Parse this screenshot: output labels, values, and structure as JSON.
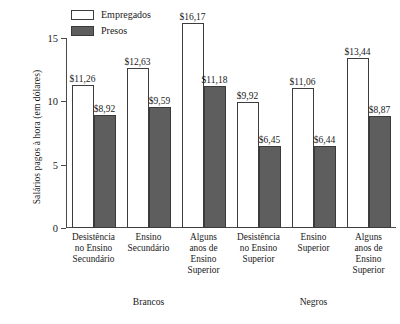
{
  "chart_data": {
    "type": "bar",
    "title": "",
    "xlabel": "",
    "ylabel": "Salários pagos à hora (em dólares)",
    "ylim": [
      0,
      15
    ],
    "yticks": [
      0,
      5,
      10,
      15
    ],
    "ytick_labels": [
      "0",
      "5",
      "10",
      "15"
    ],
    "grid": false,
    "legend_position": "top-left",
    "currency_symbol": "$",
    "decimal_separator": ",",
    "series": [
      {
        "name": "Empregados",
        "color": "#ffffff",
        "border_color": "#3c3c3c",
        "values": [
          11.26,
          12.63,
          16.17,
          9.92,
          11.06,
          13.44
        ],
        "labels": [
          "$11,26",
          "$12,63",
          "$16,17",
          "$9,92",
          "$11,06",
          "$13,44"
        ]
      },
      {
        "name": "Presos",
        "color": "#5e5e5e",
        "border_color": "#3a3a3a",
        "values": [
          8.92,
          9.59,
          11.18,
          6.45,
          6.44,
          8.87
        ],
        "labels": [
          "$8,92",
          "$9,59",
          "$11,18",
          "$6,45",
          "$6,44",
          "$8,87"
        ]
      }
    ],
    "categories": [
      {
        "lines": [
          "Desistência",
          "no Ensino",
          "Secundário"
        ],
        "group": "Brancos"
      },
      {
        "lines": [
          "Ensino",
          "Secundário"
        ],
        "group": "Brancos"
      },
      {
        "lines": [
          "Alguns",
          "anos de",
          "Ensino",
          "Superior"
        ],
        "group": "Brancos"
      },
      {
        "lines": [
          "Desistência",
          "no Ensino",
          "Superior"
        ],
        "group": "Negros"
      },
      {
        "lines": [
          "Ensino",
          "Superior"
        ],
        "group": "Negros"
      },
      {
        "lines": [
          "Alguns",
          "anos de",
          "Ensino",
          "Superior"
        ],
        "group": "Negros"
      }
    ],
    "groups": [
      {
        "label": "Brancos",
        "categories": [
          0,
          1,
          2
        ]
      },
      {
        "label": "Negros",
        "categories": [
          3,
          4,
          5
        ]
      }
    ]
  }
}
